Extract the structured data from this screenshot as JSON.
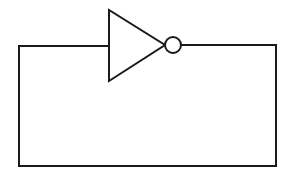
{
  "diagram": {
    "stroke_color": "#1a1a1a",
    "background": "#ffffff",
    "components": [
      {
        "type": "not-gate",
        "label": "",
        "input_x": 109,
        "output_x": 165,
        "y": 45
      }
    ],
    "wires": [
      {
        "name": "output-wire",
        "from": [
          181,
          45
        ],
        "to": [
          276,
          45
        ]
      },
      {
        "name": "right-wire",
        "from": [
          276,
          45
        ],
        "to": [
          276,
          166
        ]
      },
      {
        "name": "bottom-wire",
        "from": [
          276,
          166
        ],
        "to": [
          19,
          166
        ]
      },
      {
        "name": "left-wire",
        "from": [
          19,
          166
        ],
        "to": [
          19,
          46
        ]
      },
      {
        "name": "input-wire",
        "from": [
          19,
          46
        ],
        "to": [
          109,
          46
        ]
      }
    ]
  }
}
